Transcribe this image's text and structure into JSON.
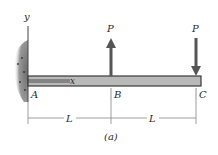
{
  "figure": {
    "caption": "(a)",
    "axes": {
      "x_label": "x",
      "y_label": "y"
    },
    "points": [
      {
        "name": "A",
        "x": 33,
        "y": 95
      },
      {
        "name": "B",
        "x": 114,
        "y": 95
      },
      {
        "name": "C",
        "x": 199,
        "y": 95
      }
    ],
    "forces": [
      {
        "label": "P",
        "at": "B",
        "direction": "up"
      },
      {
        "label": "P",
        "at": "C",
        "direction": "down"
      }
    ],
    "dimensions": [
      {
        "label": "L",
        "from": "A",
        "to": "B"
      },
      {
        "label": "L",
        "from": "B",
        "to": "C"
      }
    ],
    "colors": {
      "beam_fill": "#b9b9b9",
      "beam_stroke": "#3a3a3a",
      "arrow": "#555555",
      "wall": "#8a8a8a",
      "text": "#2a2a2a"
    }
  }
}
